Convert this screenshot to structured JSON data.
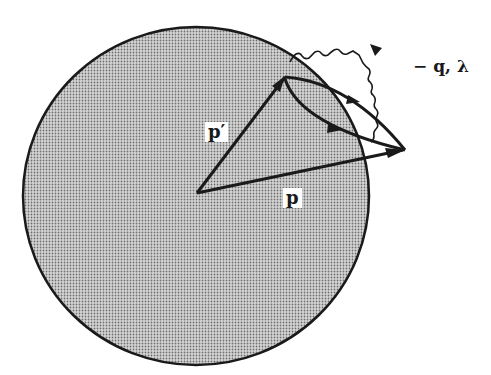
{
  "diagram": {
    "colors": {
      "sphere_fill": "#bdbdbd",
      "stroke": "#1a1a1a",
      "background": "#ffffff"
    },
    "labels": {
      "p_prime": "p′",
      "p": "p",
      "photon": "− q, λ"
    }
  }
}
